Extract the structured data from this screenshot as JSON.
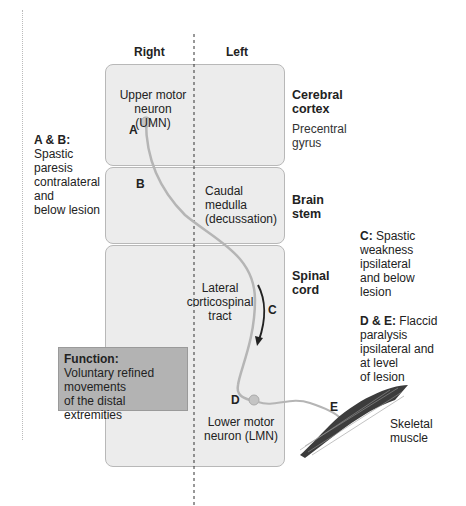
{
  "columns": {
    "right": "Right",
    "left": "Left"
  },
  "regions": {
    "cortex": {
      "title_1": "Cerebral",
      "title_2": "cortex",
      "sub_1": "Precentral",
      "sub_2": "gyrus"
    },
    "brainstem": {
      "title_1": "Brain",
      "title_2": "stem"
    },
    "spinal": {
      "title_1": "Spinal",
      "title_2": "cord"
    }
  },
  "neurons": {
    "umn_1": "Upper motor",
    "umn_2": "neuron (UMN)",
    "medulla_1": "Caudal",
    "medulla_2": "medulla",
    "medulla_3": "(decussation)",
    "tract_1": "Lateral",
    "tract_2": "corticospinal",
    "tract_3": "tract",
    "lmn_1": "Lower motor",
    "lmn_2": "neuron (LMN)",
    "muscle_1": "Skeletal",
    "muscle_2": "muscle"
  },
  "markers": {
    "a": "A",
    "b": "B",
    "c": "C",
    "d": "D",
    "e": "E"
  },
  "annotations": {
    "ab": {
      "head": "A & B:",
      "l1": "Spastic",
      "l2": "paresis",
      "l3": "contralateral",
      "l4": "and",
      "l5": "below lesion"
    },
    "c": {
      "head": "C:",
      "l1": " Spastic",
      "l2": "weakness",
      "l3": "ipsilateral",
      "l4": "and below",
      "l5": "lesion"
    },
    "de": {
      "head": "D & E:",
      "l1": " Flaccid",
      "l2": "paralysis",
      "l3": "ipsilateral and",
      "l4": "at level",
      "l5": "of lesion"
    }
  },
  "function_box": {
    "head": "Function:",
    "l1": "Voluntary refined",
    "l2": "movements",
    "l3": "of the distal extremities"
  },
  "colors": {
    "panel": "#ececec",
    "pathway": "#b5b5b5",
    "function_box": "#b3b3b3",
    "muscle": "#555555"
  }
}
